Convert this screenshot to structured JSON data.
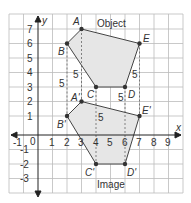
{
  "diagram": {
    "title_object": "Object",
    "title_image": "Image",
    "axis_x_label": "x",
    "axis_y_label": "y",
    "x_ticks": [
      "-1",
      "0",
      "1",
      "2",
      "3",
      "4",
      "5",
      "6",
      "7",
      "8",
      "9"
    ],
    "y_ticks": [
      "7",
      "6",
      "5",
      "4",
      "3",
      "2",
      "1",
      "-1",
      "-2",
      "-3"
    ],
    "translation_label": "5",
    "object_points": [
      {
        "name": "A",
        "x": 3,
        "y": 7
      },
      {
        "name": "B",
        "x": 2,
        "y": 6
      },
      {
        "name": "C",
        "x": 4,
        "y": 3
      },
      {
        "name": "D",
        "x": 6,
        "y": 3
      },
      {
        "name": "E",
        "x": 7,
        "y": 6
      }
    ],
    "image_points": [
      {
        "name": "A'",
        "x": 3,
        "y": 2
      },
      {
        "name": "B'",
        "x": 2,
        "y": 1
      },
      {
        "name": "C'",
        "x": 4,
        "y": -2
      },
      {
        "name": "D'",
        "x": 6,
        "y": -2
      },
      {
        "name": "E'",
        "x": 7,
        "y": 1
      }
    ],
    "colors": {
      "fill": "#e6e6e6",
      "grid": "#bbbbbb",
      "line": "#444444"
    }
  }
}
